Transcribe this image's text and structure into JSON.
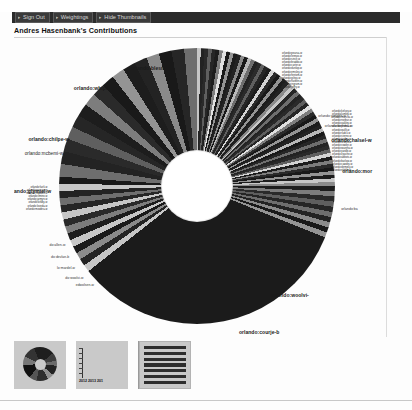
{
  "window": {
    "background": "#ffffff",
    "toolbar_bg": "#2b2b2b",
    "accent": "#2b2b2b"
  },
  "toolbar": {
    "buttons": [
      {
        "label": "Sign Out",
        "icon": "chevron-right-icon",
        "name": "sign-out-button"
      },
      {
        "label": "Weightings",
        "icon": "chevron-right-icon",
        "name": "weightings-button"
      },
      {
        "label": "Hide Thumbnails",
        "icon": "chevron-right-icon",
        "name": "hide-thumbnails-button"
      }
    ]
  },
  "header": {
    "title": "Andres Hasenbank's Contributions"
  },
  "chart_data": {
    "type": "pie",
    "title": "Andres Hasenbank's Contributions",
    "subtitle": "",
    "xlabel": "",
    "ylabel": "",
    "legend_position": "radial-labels",
    "grid": false,
    "donut_hole_ratio": 0.25,
    "note": "Sunburst / donut of per-page contribution share; one wedge per wiki page, most wedges are sub-1% slivers.",
    "categories": [
      "orlando:blesma-w",
      "orlando:whipdo-w",
      "orlando:chilpe-w",
      "orlando:mcbemi-w",
      "orlando:glymiel-w",
      "orlando:devlan-b",
      "orlando:mardel-w",
      "orlando:woolvi-w",
      "orlando:courje-b",
      "orlando:morgan-w",
      "orlando:halsel-w",
      "orlando:bethma-w",
      "orlando:yongeh-w",
      "orlando:lennox-w",
      "orlando:sinclr-w",
      "orlando:pearsa-w"
    ],
    "values": [
      38.0,
      9.2,
      5.4,
      3.6,
      3.1,
      2.7,
      2.4,
      2.1,
      1.9,
      1.7,
      1.5,
      1.3,
      1.2,
      1.1,
      1.0,
      0.9
    ],
    "remainder_label": "other pages (sub-1% slivers)",
    "remainder_value": 22.9
  },
  "wheel": {
    "labels_top": [
      {
        "text": "orlando:blesma-w",
        "style": "bold"
      },
      {
        "text": "orlando:whipdo-w",
        "style": "bold"
      }
    ],
    "labels_left": [
      {
        "text": "orlando:chilpe-w",
        "style": "bold"
      },
      {
        "text": "orlando:mcbemi-w",
        "style": "plain"
      },
      {
        "text": "lando:glymiel-w",
        "style": "bold"
      },
      {
        "text": "do:allen-w",
        "style": "tiny"
      },
      {
        "text": "do:devlan-b",
        "style": "tiny"
      },
      {
        "text": "lo:mardel-w",
        "style": "tiny"
      },
      {
        "text": "do:woolvi-w",
        "style": "tiny"
      },
      {
        "text": "edwolsen-w",
        "style": "tiny"
      }
    ],
    "labels_right": [
      {
        "text": "orlando:yongeh-w",
        "style": "tiny"
      },
      {
        "text": "orlando:bethma-w",
        "style": "tiny"
      },
      {
        "text": "orlando:halsel-w",
        "style": "bold"
      },
      {
        "text": "orlando:mor",
        "style": "bold"
      },
      {
        "text": "orlando:ba",
        "style": "tiny"
      }
    ],
    "labels_bottom": [
      {
        "text": "orlando:woolvi-",
        "style": "bold"
      },
      {
        "text": "orlando:courje-b",
        "style": "bold"
      }
    ],
    "cloud_top_right": [
      "orlando:pearsa-w",
      "orlando:lennox-w",
      "orlando:sinclr-w",
      "orlando:braddo-w",
      "orlando:carter-w",
      "orlando:dunlop-w",
      "orlando:emsley-w",
      "orlando:fentom-w",
      "orlando:gilroy-w",
      "orlando:harben-w",
      "orlando:ingram-w",
      "orlando:jeffry-w"
    ],
    "cloud_right": [
      "orlando:kelsey-w",
      "orlando:lumley-w",
      "orlando:marsha-w",
      "orlando:norbur-w",
      "orlando:oakley-w",
      "orlando:prideu-w",
      "orlando:quillt-w",
      "orlando:radcli-w",
      "orlando:sterne-w",
      "orlando:tapley-w",
      "orlando:urwick-w",
      "orlando:vowler-w",
      "orlando:wareha-w",
      "orlando:yardle-w",
      "orlando:zouche-w",
      "orlando:abbots-w",
      "orlando:barlow-w",
      "orlando:cawdry-w",
      "orlando:dempsy-w",
      "orlando:elphin-w"
    ],
    "cloud_left": [
      "orlando:fairli-w",
      "orlando:gascoy-w",
      "orlando:haddon-w",
      "orlando:ilmine-w",
      "orlando:jarmyn-w",
      "orlando:kirkby-w",
      "orlando:loveda-w",
      "orlando:mowbra-w"
    ]
  },
  "thumbnails": {
    "items": [
      {
        "name": "thumbnail-pie-chart",
        "kind": "pie",
        "caption": ""
      },
      {
        "name": "thumbnail-bar-chart",
        "kind": "bars",
        "caption": "2012 2013 201"
      },
      {
        "name": "thumbnail-hbar-chart",
        "kind": "hbars",
        "caption": ""
      }
    ],
    "bar_years": "2012 2013 201"
  }
}
